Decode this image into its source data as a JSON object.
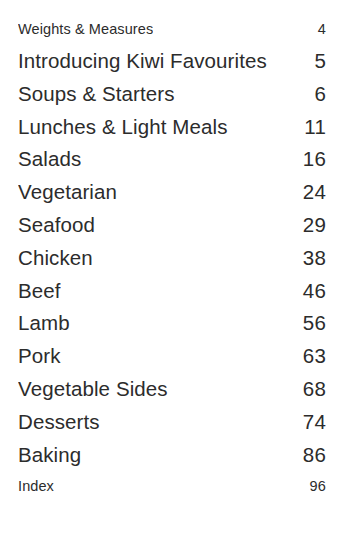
{
  "page": {
    "kind": "table-of-contents",
    "background_color": "#ffffff",
    "text_color": "#2c2c2c"
  },
  "contents": {
    "entries": [
      {
        "title": "Weights & Measures",
        "page": "4",
        "size": "minor"
      },
      {
        "title": "Introducing Kiwi Favourites",
        "page": "5",
        "size": "major"
      },
      {
        "title": "Soups & Starters",
        "page": "6",
        "size": "major"
      },
      {
        "title": "Lunches & Light Meals",
        "page": "11",
        "size": "major"
      },
      {
        "title": "Salads",
        "page": "16",
        "size": "major"
      },
      {
        "title": "Vegetarian",
        "page": "24",
        "size": "major"
      },
      {
        "title": "Seafood",
        "page": "29",
        "size": "major"
      },
      {
        "title": "Chicken",
        "page": "38",
        "size": "major"
      },
      {
        "title": "Beef",
        "page": "46",
        "size": "major"
      },
      {
        "title": "Lamb",
        "page": "56",
        "size": "major"
      },
      {
        "title": "Pork",
        "page": "63",
        "size": "major"
      },
      {
        "title": "Vegetable Sides",
        "page": "68",
        "size": "major"
      },
      {
        "title": "Desserts",
        "page": "74",
        "size": "major"
      },
      {
        "title": "Baking",
        "page": "86",
        "size": "major"
      },
      {
        "title": "Index",
        "page": "96",
        "size": "minor"
      }
    ]
  }
}
